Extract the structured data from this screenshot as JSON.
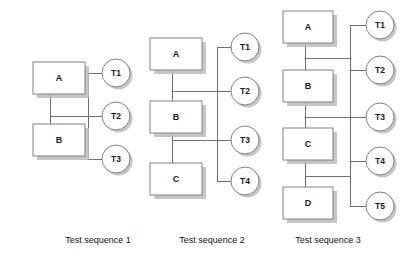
{
  "figure": {
    "background_color": "#ffffff",
    "box_fill": "#ffffff",
    "box_stroke": "#808080",
    "shadow_color": "#bcbcbc",
    "line_color": "#6e6e6e",
    "text_color": "#1a1a1a"
  },
  "sequences": [
    {
      "id": "sequence-1",
      "caption": "Test sequence 1",
      "caption_x": 98,
      "caption_y": 240,
      "bus_x": 88,
      "bus_top": 73,
      "bus_bottom": 159,
      "spine_x": 50,
      "spine_top": 93,
      "spine_bottom": 124,
      "link_y": 116,
      "modules": [
        {
          "label": "A",
          "x": 33,
          "y": 62,
          "w": 52,
          "h": 32
        },
        {
          "label": "B",
          "x": 33,
          "y": 124,
          "w": 52,
          "h": 32
        }
      ],
      "tests": [
        {
          "label": "T1",
          "cx": 116,
          "cy": 73,
          "r": 14
        },
        {
          "label": "T2",
          "cx": 116,
          "cy": 116,
          "r": 14
        },
        {
          "label": "T3",
          "cx": 116,
          "cy": 159,
          "r": 14
        }
      ]
    },
    {
      "id": "sequence-2",
      "caption": "Test sequence 2",
      "caption_x": 212,
      "caption_y": 240,
      "bus_x": 217,
      "bus_top": 47,
      "bus_bottom": 181,
      "spine_x": 172,
      "spine_top": 70,
      "spine_bottom": 163,
      "link_y_top": 91,
      "link_y_bottom": 140,
      "modules": [
        {
          "label": "A",
          "x": 150,
          "y": 38,
          "w": 52,
          "h": 32
        },
        {
          "label": "B",
          "x": 150,
          "y": 101,
          "w": 52,
          "h": 32
        },
        {
          "label": "C",
          "x": 150,
          "y": 163,
          "w": 52,
          "h": 32
        }
      ],
      "tests": [
        {
          "label": "T1",
          "cx": 245,
          "cy": 47,
          "r": 14
        },
        {
          "label": "T2",
          "cx": 245,
          "cy": 91,
          "r": 14
        },
        {
          "label": "T3",
          "cx": 245,
          "cy": 140,
          "r": 14
        },
        {
          "label": "T4",
          "cx": 245,
          "cy": 181,
          "r": 14
        }
      ]
    },
    {
      "id": "sequence-3",
      "caption": "Test sequence 3",
      "caption_x": 328,
      "caption_y": 240,
      "bus_x": 350,
      "bus_top": 25,
      "bus_bottom": 206,
      "spine_x": 305,
      "spine_top": 43,
      "spine_bottom": 187,
      "link_y_top": 58,
      "link_y_mid": 117,
      "link_y_bottom": 176,
      "modules": [
        {
          "label": "A",
          "x": 283,
          "y": 11,
          "w": 50,
          "h": 32
        },
        {
          "label": "B",
          "x": 283,
          "y": 70,
          "w": 50,
          "h": 32
        },
        {
          "label": "C",
          "x": 283,
          "y": 128,
          "w": 50,
          "h": 32
        },
        {
          "label": "D",
          "x": 283,
          "y": 187,
          "w": 50,
          "h": 32
        }
      ],
      "tests": [
        {
          "label": "T1",
          "cx": 380,
          "cy": 25,
          "r": 14
        },
        {
          "label": "T2",
          "cx": 380,
          "cy": 70,
          "r": 14
        },
        {
          "label": "T3",
          "cx": 380,
          "cy": 117,
          "r": 14
        },
        {
          "label": "T4",
          "cx": 380,
          "cy": 161,
          "r": 14
        },
        {
          "label": "T5",
          "cx": 380,
          "cy": 206,
          "r": 14
        }
      ]
    }
  ]
}
